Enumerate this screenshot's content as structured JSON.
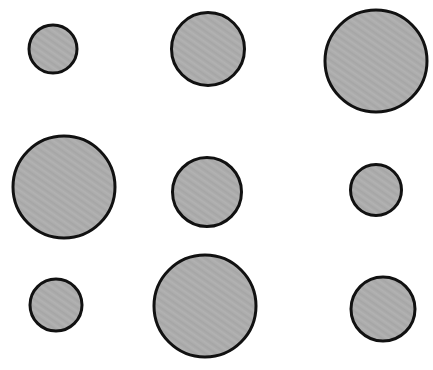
{
  "page": {
    "background_color": "#ffffff",
    "width": 433,
    "height": 370
  },
  "style": {
    "fill_color": "#acacac",
    "stroke_color": "#111111",
    "stroke_width": 3,
    "texture": "subtle-diagonal-grain"
  },
  "chart_data": {
    "type": "scatter",
    "title": "",
    "subtitle": "",
    "xlabel": "",
    "ylabel": "",
    "xlim": [
      0,
      433
    ],
    "ylim": [
      0,
      370
    ],
    "grid": false,
    "legend": null,
    "annotations": [],
    "layout": "3x3 grid of filled circles of varying diameter",
    "marker": {
      "shape": "circle",
      "fill": "#acacac",
      "edge_color": "#111111",
      "edge_width": 3
    },
    "fields": [
      "id",
      "row",
      "col",
      "cx",
      "cy",
      "diameter",
      "radius",
      "area"
    ],
    "points": [
      {
        "id": "circle-r1c1",
        "row": 1,
        "col": 1,
        "cx": 53,
        "cy": 49,
        "diameter": 48,
        "radius": 24,
        "area": 1810,
        "size_label": "small"
      },
      {
        "id": "circle-r1c2",
        "row": 1,
        "col": 2,
        "cx": 208,
        "cy": 49,
        "diameter": 73,
        "radius": 36.5,
        "area": 4185,
        "size_label": "medium"
      },
      {
        "id": "circle-r1c3",
        "row": 1,
        "col": 3,
        "cx": 376,
        "cy": 61,
        "diameter": 102,
        "radius": 51,
        "area": 8171,
        "size_label": "large"
      },
      {
        "id": "circle-r2c1",
        "row": 2,
        "col": 1,
        "cx": 64,
        "cy": 187,
        "diameter": 102,
        "radius": 51,
        "area": 8171,
        "size_label": "large"
      },
      {
        "id": "circle-r2c2",
        "row": 2,
        "col": 2,
        "cx": 207,
        "cy": 192,
        "diameter": 69,
        "radius": 34.5,
        "area": 3739,
        "size_label": "medium"
      },
      {
        "id": "circle-r2c3",
        "row": 2,
        "col": 3,
        "cx": 376,
        "cy": 190,
        "diameter": 51,
        "radius": 25.5,
        "area": 2043,
        "size_label": "small"
      },
      {
        "id": "circle-r3c1",
        "row": 3,
        "col": 1,
        "cx": 56,
        "cy": 305,
        "diameter": 52,
        "radius": 26,
        "area": 2124,
        "size_label": "small"
      },
      {
        "id": "circle-r3c2",
        "row": 3,
        "col": 2,
        "cx": 205,
        "cy": 306,
        "diameter": 102,
        "radius": 51,
        "area": 8171,
        "size_label": "large"
      },
      {
        "id": "circle-r3c3",
        "row": 3,
        "col": 3,
        "cx": 383,
        "cy": 309,
        "diameter": 64,
        "radius": 32,
        "area": 3217,
        "size_label": "medium"
      }
    ]
  }
}
